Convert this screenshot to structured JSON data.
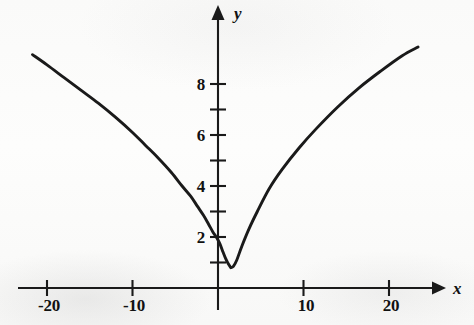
{
  "figure": {
    "background_color": "#fdfdfc",
    "ink_color": "#1a1a1a"
  },
  "axes": {
    "x_axis_label": "x",
    "y_axis_label": "y",
    "x_axis_name": "x-axis",
    "y_axis_name": "y-axis",
    "origin_px": {
      "x": 218,
      "y": 288
    },
    "px_per_x_unit": 8.55,
    "px_per_y_unit": 25.5,
    "x_arrow_tip_px": 446,
    "y_arrow_tip_px": 5
  },
  "chart_data": {
    "type": "line",
    "title": "",
    "subtitle": "",
    "xlabel": "x",
    "ylabel": "y",
    "xlim": [
      -23,
      26
    ],
    "ylim": [
      -1.2,
      11
    ],
    "grid": false,
    "legend": null,
    "x_ticks": [
      -20,
      -10,
      10,
      20
    ],
    "x_tick_labels": [
      "-20",
      "-10",
      "10",
      "20"
    ],
    "x_minor_ticks": [],
    "y_ticks": [
      1,
      2,
      3,
      4,
      5,
      6,
      7,
      8
    ],
    "y_tick_labels": [
      "",
      "2",
      "",
      "4",
      "",
      "6",
      "",
      "8"
    ],
    "y_labeled_ticks": [
      2,
      4,
      6,
      8
    ],
    "annotations": [],
    "series": [
      {
        "name": "curve",
        "description": "V-shaped curve with a cusp minimum just right of the y-axis, concave-down arms rising to about y=9 at both ends",
        "x": [
          -21.7,
          -20.0,
          -18.0,
          -16.0,
          -14.0,
          -12.0,
          -10.0,
          -8.5,
          -7.0,
          -5.5,
          -4.2,
          -3.2,
          -2.4,
          -1.7,
          -1.1,
          -0.6,
          -0.2,
          0.2,
          0.6,
          0.9,
          1.2,
          1.5,
          1.8,
          2.2,
          2.8,
          3.6,
          4.6,
          6.0,
          7.5,
          9.5,
          11.5,
          14.0,
          16.5,
          19.0,
          21.5,
          23.4
        ],
        "y": [
          9.15,
          8.75,
          8.25,
          7.75,
          7.25,
          6.7,
          6.1,
          5.6,
          5.1,
          4.55,
          4.0,
          3.6,
          3.2,
          2.85,
          2.5,
          2.2,
          2.0,
          1.75,
          1.4,
          1.15,
          0.95,
          0.8,
          0.85,
          1.1,
          1.65,
          2.3,
          3.0,
          3.9,
          4.65,
          5.5,
          6.25,
          7.1,
          7.85,
          8.5,
          9.1,
          9.45
        ]
      }
    ]
  }
}
